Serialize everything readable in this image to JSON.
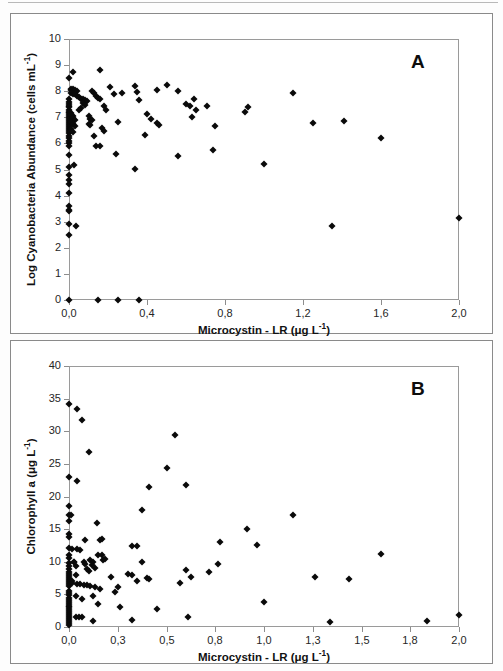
{
  "figure": {
    "panels": [
      "A",
      "B"
    ],
    "marker_color": "#0a0a0a",
    "frame_color": "#8d8d8d",
    "panel_a_letter": "A",
    "panel_b_letter": "B"
  },
  "chart_data": [
    {
      "type": "scatter",
      "panel": "A",
      "title": "",
      "xlabel": "Microcystin - LR (μg L⁻¹)",
      "ylabel": "Log Cyanobacteria Abundance (cells mL⁻¹)",
      "xlabel_parts": {
        "main": "Microcystin - LR (",
        "unit_base": "μg L",
        "unit_exp": "-1",
        "close": ")"
      },
      "ylabel_parts": {
        "main": "Log Cyanobacteria Abundance (cells mL",
        "unit_exp": "-1",
        "close": ")"
      },
      "xlim": [
        0.0,
        2.0
      ],
      "ylim": [
        0,
        10
      ],
      "xticks": [
        0.0,
        0.4,
        0.8,
        1.2,
        1.6,
        2.0
      ],
      "xticklabels": [
        "0,0",
        "0,4",
        "0,8",
        "1,2",
        "1,6",
        "2,0"
      ],
      "yticks": [
        0,
        1,
        2,
        3,
        4,
        5,
        6,
        7,
        8,
        9,
        10
      ],
      "yticklabels": [
        "0",
        "1",
        "2",
        "3",
        "4",
        "5",
        "6",
        "7",
        "8",
        "9",
        "10"
      ],
      "grid": false,
      "legend": "none",
      "points": [
        [
          0.0,
          8.52
        ],
        [
          0.02,
          8.75
        ],
        [
          0.16,
          8.8
        ],
        [
          0.01,
          8.1
        ],
        [
          0.01,
          8.05
        ],
        [
          0.02,
          8.08
        ],
        [
          0.03,
          8.05
        ],
        [
          0.04,
          8.02
        ],
        [
          0.01,
          7.95
        ],
        [
          0.02,
          7.9
        ],
        [
          0.03,
          7.88
        ],
        [
          0.04,
          7.8
        ],
        [
          0.05,
          7.78
        ],
        [
          0.06,
          7.72
        ],
        [
          0.07,
          7.7
        ],
        [
          0.08,
          7.66
        ],
        [
          0.09,
          7.62
        ],
        [
          0.12,
          8.02
        ],
        [
          0.13,
          7.95
        ],
        [
          0.14,
          7.8
        ],
        [
          0.15,
          7.74
        ],
        [
          0.16,
          7.72
        ],
        [
          0.21,
          8.18
        ],
        [
          0.23,
          7.88
        ],
        [
          0.27,
          7.95
        ],
        [
          0.34,
          8.22
        ],
        [
          0.35,
          7.98
        ],
        [
          0.36,
          7.65
        ],
        [
          0.45,
          8.05
        ],
        [
          0.5,
          8.23
        ],
        [
          0.56,
          8.02
        ],
        [
          0.6,
          7.52
        ],
        [
          0.62,
          7.42
        ],
        [
          0.64,
          7.72
        ],
        [
          0.65,
          7.28
        ],
        [
          0.63,
          7.0
        ],
        [
          0.71,
          7.45
        ],
        [
          0.75,
          6.68
        ],
        [
          0.9,
          7.22
        ],
        [
          0.92,
          7.4
        ],
        [
          1.15,
          7.92
        ],
        [
          1.25,
          6.78
        ],
        [
          1.41,
          6.86
        ],
        [
          1.6,
          6.22
        ],
        [
          2.0,
          3.14
        ],
        [
          0.0,
          7.72
        ],
        [
          0.0,
          7.6
        ],
        [
          0.0,
          7.52
        ],
        [
          0.0,
          7.45
        ],
        [
          0.0,
          7.38
        ],
        [
          0.0,
          7.3
        ],
        [
          0.0,
          7.22
        ],
        [
          0.0,
          7.15
        ],
        [
          0.0,
          7.08
        ],
        [
          0.0,
          7.0
        ],
        [
          0.0,
          6.92
        ],
        [
          0.0,
          6.85
        ],
        [
          0.0,
          6.78
        ],
        [
          0.0,
          6.7
        ],
        [
          0.0,
          6.62
        ],
        [
          0.0,
          6.55
        ],
        [
          0.0,
          6.48
        ],
        [
          0.0,
          6.4
        ],
        [
          0.0,
          6.3
        ],
        [
          0.0,
          6.2
        ],
        [
          0.0,
          6.1
        ],
        [
          0.0,
          6.0
        ],
        [
          0.0,
          5.9
        ],
        [
          0.0,
          5.55
        ],
        [
          0.0,
          5.08
        ],
        [
          0.0,
          4.8
        ],
        [
          0.0,
          4.6
        ],
        [
          0.0,
          4.45
        ],
        [
          0.0,
          4.1
        ],
        [
          0.0,
          3.62
        ],
        [
          0.0,
          3.45
        ],
        [
          0.0,
          3.4
        ],
        [
          0.0,
          2.9
        ],
        [
          0.0,
          2.5
        ],
        [
          0.01,
          7.18
        ],
        [
          0.01,
          7.1
        ],
        [
          0.02,
          7.05
        ],
        [
          0.02,
          6.98
        ],
        [
          0.03,
          6.9
        ],
        [
          0.01,
          6.82
        ],
        [
          0.02,
          6.75
        ],
        [
          0.03,
          6.68
        ],
        [
          0.01,
          6.55
        ],
        [
          0.02,
          6.45
        ],
        [
          0.025,
          5.18
        ],
        [
          0.035,
          2.82
        ],
        [
          0.1,
          7.05
        ],
        [
          0.11,
          6.95
        ],
        [
          0.12,
          6.9
        ],
        [
          0.1,
          6.75
        ],
        [
          0.11,
          6.7
        ],
        [
          0.13,
          6.28
        ],
        [
          0.14,
          5.92
        ],
        [
          0.16,
          5.92
        ],
        [
          0.18,
          7.45
        ],
        [
          0.19,
          7.3
        ],
        [
          0.17,
          6.58
        ],
        [
          0.18,
          6.48
        ],
        [
          0.24,
          5.58
        ],
        [
          0.25,
          6.82
        ],
        [
          0.34,
          5.02
        ],
        [
          0.39,
          6.32
        ],
        [
          0.4,
          7.12
        ],
        [
          0.42,
          6.95
        ],
        [
          0.45,
          6.78
        ],
        [
          0.46,
          6.72
        ],
        [
          0.56,
          5.5
        ],
        [
          0.74,
          5.75
        ],
        [
          1.0,
          5.2
        ],
        [
          1.35,
          2.82
        ],
        [
          0.07,
          7.55
        ],
        [
          0.08,
          7.48
        ],
        [
          0.06,
          7.35
        ],
        [
          0.05,
          7.28
        ],
        [
          0.0,
          0.0
        ],
        [
          0.15,
          0.0
        ],
        [
          0.25,
          0.0
        ],
        [
          0.36,
          0.0
        ]
      ]
    },
    {
      "type": "scatter",
      "panel": "B",
      "title": "",
      "xlabel": "Microcystin - LR (μg L⁻¹)",
      "ylabel": "Chlorophyll a (μg L⁻¹)",
      "xlabel_parts": {
        "main": "Microcystin - LR (",
        "unit_base": "μg L",
        "unit_exp": "-1",
        "close": ")"
      },
      "ylabel_parts": {
        "main": "Chlorophyll a (",
        "unit_base": "μg L",
        "unit_exp": "-1",
        "close": ")"
      },
      "xlim": [
        0.0,
        2.0
      ],
      "ylim": [
        0,
        40
      ],
      "xticks": [
        0.0,
        0.3,
        0.5,
        0.8,
        1.0,
        1.3,
        1.5,
        1.8,
        2.0
      ],
      "xticklabels": [
        "0,0",
        "0,3",
        "0,5",
        "0,8",
        "1,0",
        "1,3",
        "1,5",
        "1,8",
        "2,0"
      ],
      "yticks": [
        0,
        5,
        10,
        15,
        20,
        25,
        30,
        35,
        40
      ],
      "yticklabels": [
        "0",
        "5",
        "10",
        "15",
        "20",
        "25",
        "30",
        "35",
        "40"
      ],
      "grid": false,
      "legend": "none",
      "points": [
        [
          0.0,
          34.2
        ],
        [
          0.05,
          33.4
        ],
        [
          0.08,
          31.7
        ],
        [
          0.55,
          29.5
        ],
        [
          0.12,
          26.9
        ],
        [
          0.0,
          23.0
        ],
        [
          0.05,
          22.4
        ],
        [
          0.5,
          24.3
        ],
        [
          0.43,
          21.4
        ],
        [
          0.62,
          21.8
        ],
        [
          0.0,
          18.5
        ],
        [
          0.0,
          17.2
        ],
        [
          0.01,
          17.1
        ],
        [
          0.0,
          16.2
        ],
        [
          0.4,
          18.0
        ],
        [
          1.18,
          17.1
        ],
        [
          0.17,
          16.0
        ],
        [
          0.93,
          15.0
        ],
        [
          0.0,
          14.2
        ],
        [
          0.0,
          13.8
        ],
        [
          0.1,
          13.4
        ],
        [
          0.2,
          13.5
        ],
        [
          0.19,
          13.3
        ],
        [
          0.82,
          13.0
        ],
        [
          0.97,
          12.5
        ],
        [
          0.0,
          12.1
        ],
        [
          0.02,
          11.9
        ],
        [
          0.05,
          11.9
        ],
        [
          0.07,
          11.8
        ],
        [
          0.36,
          12.4
        ],
        [
          0.38,
          12.4
        ],
        [
          1.62,
          11.2
        ],
        [
          0.0,
          11.0
        ],
        [
          0.0,
          10.6
        ],
        [
          0.18,
          11.1
        ],
        [
          0.2,
          11.1
        ],
        [
          0.13,
          10.2
        ],
        [
          0.15,
          10.0
        ],
        [
          0.21,
          10.3
        ],
        [
          0.22,
          10.4
        ],
        [
          0.4,
          9.9
        ],
        [
          0.81,
          9.7
        ],
        [
          0.0,
          9.8
        ],
        [
          0.0,
          9.4
        ],
        [
          0.04,
          9.3
        ],
        [
          0.14,
          9.5
        ],
        [
          0.16,
          9.0
        ],
        [
          0.12,
          8.6
        ],
        [
          0.34,
          8.2
        ],
        [
          0.36,
          8.0
        ],
        [
          0.62,
          8.7
        ],
        [
          0.76,
          8.5
        ],
        [
          0.0,
          8.9
        ],
        [
          0.0,
          8.5
        ],
        [
          0.0,
          8.2
        ],
        [
          0.04,
          8.0
        ],
        [
          0.0,
          7.8
        ],
        [
          0.0,
          7.5
        ],
        [
          0.0,
          7.2
        ],
        [
          0.38,
          7.1
        ],
        [
          0.42,
          7.5
        ],
        [
          0.43,
          7.4
        ],
        [
          0.26,
          7.6
        ],
        [
          1.31,
          7.7
        ],
        [
          1.45,
          7.3
        ],
        [
          0.0,
          6.9
        ],
        [
          0.0,
          6.6
        ],
        [
          0.0,
          6.3
        ],
        [
          0.05,
          6.6
        ],
        [
          0.07,
          6.6
        ],
        [
          0.09,
          6.5
        ],
        [
          0.11,
          6.4
        ],
        [
          0.13,
          6.3
        ],
        [
          0.16,
          6.2
        ],
        [
          0.19,
          5.9
        ],
        [
          0.3,
          6.1
        ],
        [
          0.58,
          6.8
        ],
        [
          0.65,
          7.6
        ],
        [
          0.28,
          5.4
        ],
        [
          0.0,
          5.6
        ],
        [
          0.0,
          5.2
        ],
        [
          0.0,
          4.9
        ],
        [
          0.0,
          4.5
        ],
        [
          0.04,
          4.7
        ],
        [
          0.08,
          4.3
        ],
        [
          0.15,
          4.8
        ],
        [
          0.0,
          4.2
        ],
        [
          0.0,
          3.9
        ],
        [
          0.0,
          3.6
        ],
        [
          0.0,
          3.3
        ],
        [
          0.18,
          3.5
        ],
        [
          0.31,
          3.0
        ],
        [
          0.46,
          2.7
        ],
        [
          1.0,
          3.8
        ],
        [
          0.0,
          3.0
        ],
        [
          0.0,
          2.7
        ],
        [
          0.0,
          2.4
        ],
        [
          0.0,
          2.1
        ],
        [
          0.0,
          1.8
        ],
        [
          0.0,
          1.5
        ],
        [
          0.0,
          1.2
        ],
        [
          0.0,
          0.9
        ],
        [
          0.0,
          0.6
        ],
        [
          0.0,
          0.3
        ],
        [
          0.04,
          1.5
        ],
        [
          0.06,
          1.5
        ],
        [
          0.08,
          1.5
        ],
        [
          0.15,
          1.0
        ],
        [
          0.36,
          1.1
        ],
        [
          0.63,
          1.6
        ],
        [
          1.37,
          0.7
        ],
        [
          1.87,
          0.9
        ],
        [
          2.0,
          1.8
        ],
        [
          0.02,
          7.0
        ],
        [
          0.02,
          6.8
        ],
        [
          0.03,
          10.0
        ],
        [
          0.03,
          9.9
        ],
        [
          0.09,
          9.9
        ],
        [
          0.1,
          9.6
        ],
        [
          0.11,
          8.9
        ]
      ]
    }
  ]
}
